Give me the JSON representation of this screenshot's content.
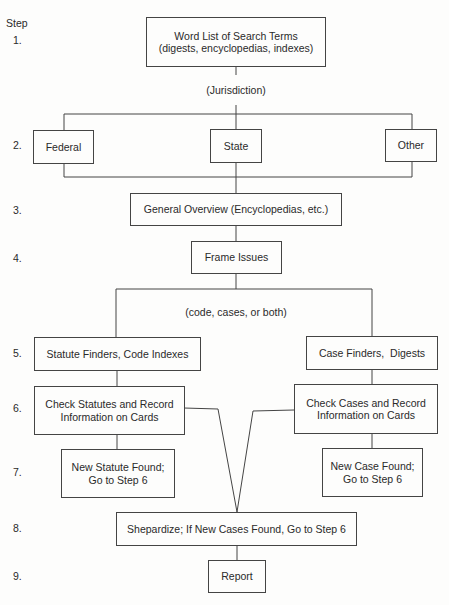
{
  "diagram": {
    "type": "flowchart",
    "step_header": "Step",
    "step_numbers": [
      "1.",
      "2.",
      "3.",
      "4.",
      "5.",
      "6.",
      "7.",
      "8.",
      "9."
    ],
    "annotations": {
      "jurisdiction": "(Jurisdiction)",
      "code_cases": "(code, cases, or both)"
    },
    "nodes": {
      "word_list": "Word List of Search Terms (digests, encyclopedias, indexes)",
      "word_list_line1": "Word List of Search Terms",
      "word_list_line2": "(digests, encyclopedias, indexes)",
      "federal": "Federal",
      "state": "State",
      "other": "Other",
      "overview": "General Overview (Encyclopedias, etc.)",
      "frame_issues": "Frame Issues",
      "statute_finders": "Statute Finders, Code Indexes",
      "case_finders": "Case Finders,  Digests",
      "check_statutes_line1": "Check Statutes and Record",
      "check_statutes_line2": "Information on Cards",
      "check_cases_line1": "Check Cases and Record",
      "check_cases_line2": "Information on Cards",
      "new_statute_line1": "New Statute Found;",
      "new_statute_line2": "Go to Step 6",
      "new_case_line1": "New Case Found;",
      "new_case_line2": "Go to Step 6",
      "shepardize": "Shepardize; If New Cases Found, Go to Step 6",
      "report": "Report"
    },
    "edges": [
      [
        "word_list",
        "federal"
      ],
      [
        "word_list",
        "state"
      ],
      [
        "word_list",
        "other"
      ],
      [
        "federal",
        "overview"
      ],
      [
        "state",
        "overview"
      ],
      [
        "other",
        "overview"
      ],
      [
        "overview",
        "frame_issues"
      ],
      [
        "frame_issues",
        "statute_finders"
      ],
      [
        "frame_issues",
        "case_finders"
      ],
      [
        "statute_finders",
        "check_statutes"
      ],
      [
        "case_finders",
        "check_cases"
      ],
      [
        "check_statutes",
        "new_statute"
      ],
      [
        "check_cases",
        "new_case"
      ],
      [
        "check_statutes",
        "shepardize"
      ],
      [
        "check_cases",
        "shepardize"
      ],
      [
        "shepardize",
        "report"
      ]
    ]
  }
}
